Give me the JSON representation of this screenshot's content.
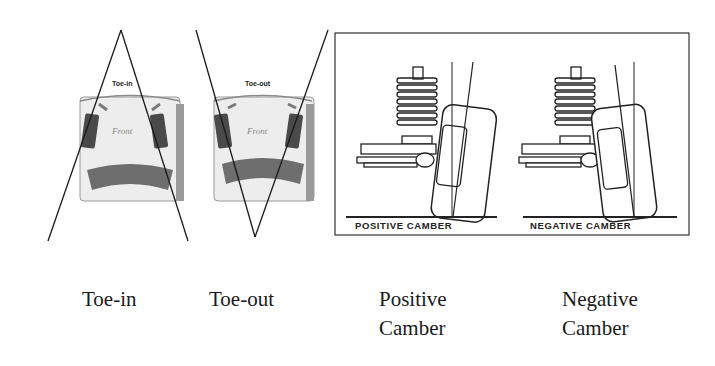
{
  "diagram": {
    "panels": [
      {
        "id": "toe-in",
        "inner_label": "Toe-in",
        "front_label": "Front",
        "caption": "Toe-in"
      },
      {
        "id": "toe-out",
        "inner_label": "Toe-out",
        "front_label": "Front",
        "caption": "Toe-out"
      },
      {
        "id": "positive-camber",
        "inner_label": "POSITIVE CAMBER",
        "caption_line1": "Positive",
        "caption_line2": "Camber"
      },
      {
        "id": "negative-camber",
        "inner_label": "NEGATIVE CAMBER",
        "caption_line1": "Negative",
        "caption_line2": "Camber"
      }
    ],
    "colors": {
      "line": "#1a1a1a",
      "car_body": "#ececec",
      "car_dark": "#6e6e6e",
      "tire": "#4a4a4a",
      "background": "#ffffff"
    }
  }
}
